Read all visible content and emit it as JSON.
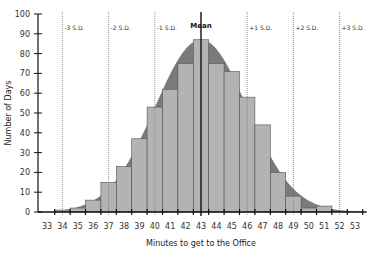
{
  "chart_data": {
    "type": "bar",
    "title": "",
    "xlabel": "Minutes to get to the Office",
    "ylabel": "Number of Days",
    "ylim": [
      0,
      100
    ],
    "yticks": [
      0,
      10,
      20,
      30,
      40,
      50,
      60,
      70,
      80,
      90,
      100
    ],
    "categories": [
      33,
      34,
      35,
      36,
      37,
      38,
      39,
      40,
      41,
      42,
      43,
      44,
      45,
      46,
      47,
      48,
      49,
      50,
      51,
      52,
      53
    ],
    "values": [
      0,
      1,
      2,
      6,
      15,
      23,
      37,
      53,
      62,
      75,
      87,
      75,
      71,
      58,
      44,
      20,
      8,
      2,
      3,
      0,
      0
    ],
    "overlay": {
      "type": "normal-curve",
      "mean": 43,
      "sd": 3,
      "peak": 87
    },
    "reference_lines": [
      {
        "x": 34,
        "label": "-3 S.D."
      },
      {
        "x": 37,
        "label": "-2 S.D."
      },
      {
        "x": 40,
        "label": "-1 S.D."
      },
      {
        "x": 43,
        "label": "Mean"
      },
      {
        "x": 46,
        "label": "+1 S.D."
      },
      {
        "x": 49,
        "label": "+2 S.D."
      },
      {
        "x": 52,
        "label": "+3 S.D."
      }
    ],
    "grid": false,
    "colors": {
      "bar": "#b3b3b3",
      "bar_edge": "#555555",
      "curve_fill": "#7a7a7a",
      "axis": "#111111",
      "sd_line": "#777777"
    }
  }
}
